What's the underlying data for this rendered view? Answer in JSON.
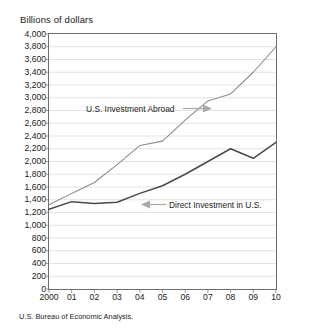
{
  "axis_title": "Billions of dollars",
  "source_note": "U.S. Bureau of Economic Analysis.",
  "annotations": {
    "abroad": "U.S. Investment Abroad",
    "inward": "Direct Investment in U.S."
  },
  "colors": {
    "series_abroad": "#8c8c8c",
    "series_inward": "#4a4a4a",
    "grid": "#d7d7d7",
    "frame": "#6e6e6e",
    "arrow": "#a8a8a8",
    "text": "#1a1a1a",
    "background": "#ffffff"
  },
  "chart_data": {
    "type": "line",
    "title": "",
    "xlabel": "",
    "ylabel": "Billions of dollars",
    "ylim": [
      0,
      4000
    ],
    "ytick_step": 200,
    "grid": true,
    "legend": "inline-annotations",
    "x": [
      "2000",
      "01",
      "02",
      "03",
      "04",
      "05",
      "06",
      "07",
      "08",
      "09",
      "10"
    ],
    "x_full_years": [
      2000,
      2001,
      2002,
      2003,
      2004,
      2005,
      2006,
      2007,
      2008,
      2009,
      2010
    ],
    "ytick_labels": [
      "0",
      "200",
      "400",
      "600",
      "800",
      "1,000",
      "1,200",
      "1,400",
      "1,600",
      "1,800",
      "2,000",
      "2,200",
      "2,400",
      "2,600",
      "2,800",
      "3,000",
      "3,200",
      "3,400",
      "3,600",
      "3,800",
      "4,000"
    ],
    "ytick_values": [
      0,
      200,
      400,
      600,
      800,
      1000,
      1200,
      1400,
      1600,
      1800,
      2000,
      2200,
      2400,
      2600,
      2800,
      3000,
      3200,
      3400,
      3600,
      3800,
      4000
    ],
    "series": [
      {
        "name": "U.S. Investment Abroad",
        "color": "#8c8c8c",
        "values": [
          1320,
          1500,
          1670,
          1950,
          2250,
          2320,
          2650,
          2950,
          3060,
          3400,
          3800
        ]
      },
      {
        "name": "Direct Investment in U.S.",
        "color": "#4a4a4a",
        "values": [
          1250,
          1370,
          1340,
          1360,
          1500,
          1620,
          1800,
          2000,
          2200,
          2050,
          2300
        ]
      }
    ]
  }
}
